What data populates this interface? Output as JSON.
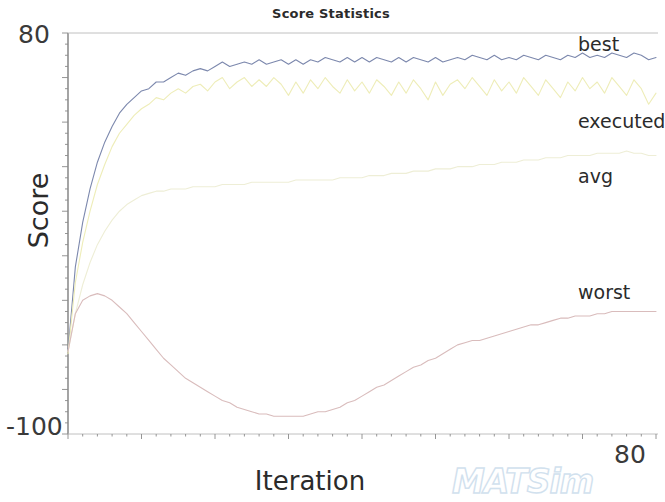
{
  "chart_data": {
    "type": "line",
    "title": "Score Statistics",
    "xlabel": "Iteration",
    "ylabel": "Score",
    "xlim": [
      0,
      80
    ],
    "ylim": [
      -100,
      80
    ],
    "x_ticks": [
      "0",
      "80"
    ],
    "y_ticks": [
      "-100",
      "80"
    ],
    "x_tick_right_label": "80",
    "y_tick_top_label": "80",
    "y_tick_bottom_label": "-100",
    "grid": false,
    "legend_position": "inline-right-of-line-ends",
    "watermark": "MATSim",
    "watermark_color": "#cfe0ee",
    "x": [
      0,
      1,
      2,
      3,
      4,
      5,
      6,
      7,
      8,
      9,
      10,
      11,
      12,
      13,
      14,
      15,
      16,
      17,
      18,
      19,
      20,
      21,
      22,
      23,
      24,
      25,
      26,
      27,
      28,
      29,
      30,
      31,
      32,
      33,
      34,
      35,
      36,
      37,
      38,
      39,
      40,
      41,
      42,
      43,
      44,
      45,
      46,
      47,
      48,
      49,
      50,
      51,
      52,
      53,
      54,
      55,
      56,
      57,
      58,
      59,
      60,
      61,
      62,
      63,
      64,
      65,
      66,
      67,
      68,
      69,
      70,
      71,
      72,
      73,
      74,
      75,
      76,
      77,
      78,
      79,
      80
    ],
    "series": [
      {
        "name": "best",
        "color": "#7c88ad",
        "values": [
          -63,
          -25,
          -5,
          10,
          22,
          31,
          38,
          44,
          48,
          51,
          54,
          55,
          58,
          58,
          60,
          62,
          61,
          63,
          64,
          63,
          65,
          67,
          65,
          66,
          67,
          66,
          68,
          66,
          67,
          68,
          66,
          68,
          66,
          68,
          67,
          69,
          68,
          67,
          69,
          67,
          69,
          67,
          69,
          68,
          67,
          69,
          67,
          69,
          68,
          67,
          69,
          67,
          68,
          69,
          68,
          70,
          69,
          68,
          70,
          68,
          69,
          68,
          70,
          69,
          68,
          70,
          69,
          68,
          70,
          69,
          71,
          69,
          70,
          69,
          71,
          70,
          69,
          71,
          70,
          68,
          69
        ]
      },
      {
        "name": "executed",
        "color": "#eeedb8",
        "values": [
          -64,
          -32,
          -14,
          0,
          12,
          21,
          29,
          35,
          39,
          43,
          46,
          48,
          51,
          50,
          53,
          55,
          53,
          56,
          57,
          54,
          58,
          60,
          55,
          58,
          60,
          56,
          59,
          56,
          60,
          57,
          52,
          58,
          53,
          59,
          55,
          60,
          56,
          53,
          59,
          54,
          58,
          53,
          59,
          56,
          52,
          58,
          53,
          59,
          55,
          50,
          58,
          52,
          57,
          59,
          55,
          60,
          56,
          52,
          59,
          54,
          58,
          53,
          60,
          56,
          52,
          59,
          55,
          51,
          58,
          54,
          60,
          55,
          58,
          53,
          60,
          56,
          52,
          59,
          55,
          48,
          53
        ]
      },
      {
        "name": "avg",
        "color": "#eeeed6",
        "values": [
          -63,
          -46,
          -33,
          -23,
          -15,
          -9,
          -4,
          0,
          3,
          5,
          7,
          8,
          9,
          9,
          10,
          10,
          10,
          11,
          11,
          11,
          11,
          12,
          12,
          12,
          12,
          13,
          13,
          13,
          13,
          13,
          13,
          14,
          14,
          14,
          14,
          14,
          14,
          15,
          15,
          15,
          15,
          16,
          16,
          16,
          17,
          17,
          17,
          18,
          18,
          18,
          19,
          19,
          19,
          20,
          20,
          20,
          21,
          21,
          21,
          22,
          22,
          22,
          23,
          23,
          23,
          24,
          24,
          24,
          25,
          25,
          25,
          25,
          26,
          26,
          26,
          26,
          27,
          26,
          26,
          25,
          25
        ]
      },
      {
        "name": "worst",
        "color": "#d9bcbc",
        "values": [
          -63,
          -46,
          -40,
          -38,
          -37,
          -38,
          -40,
          -43,
          -46,
          -50,
          -54,
          -58,
          -62,
          -66,
          -69,
          -72,
          -75,
          -77,
          -79,
          -81,
          -83,
          -85,
          -86,
          -88,
          -89,
          -90,
          -91,
          -91,
          -92,
          -92,
          -92,
          -92,
          -92,
          -91,
          -90,
          -90,
          -89,
          -88,
          -86,
          -85,
          -83,
          -81,
          -79,
          -78,
          -76,
          -74,
          -72,
          -70,
          -69,
          -67,
          -66,
          -64,
          -62,
          -60,
          -59,
          -58,
          -58,
          -57,
          -56,
          -55,
          -54,
          -53,
          -52,
          -51,
          -51,
          -50,
          -49,
          -48,
          -48,
          -47,
          -47,
          -47,
          -46,
          -46,
          -45,
          -45,
          -45,
          -45,
          -45,
          -45,
          -45
        ]
      }
    ]
  },
  "labels": {
    "series_best": "best",
    "series_executed": "executed",
    "series_avg": "avg",
    "series_worst": "worst"
  }
}
